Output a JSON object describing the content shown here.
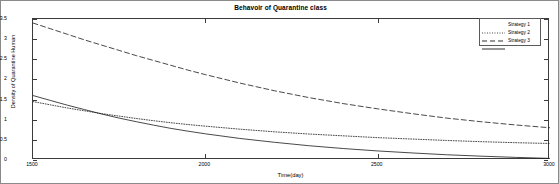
{
  "chart_data": {
    "type": "line",
    "title": "Behavoir of Quarantine class",
    "xlabel": "Time(day)",
    "ylabel": "Density of Quarantine Human",
    "xlim": [
      1500,
      3000
    ],
    "ylim": [
      0,
      3.5
    ],
    "grid": false,
    "legend_position": "top-right",
    "xticks": [
      1500,
      2000,
      2500,
      3000
    ],
    "xtick_labels": [
      "1500",
      "2000",
      "2500",
      "3000"
    ],
    "yticks": [
      0,
      0.5,
      1,
      1.5,
      2,
      2.5,
      3,
      3.5
    ],
    "ytick_labels": [
      "0",
      "0.5",
      "1",
      "1.5",
      "2",
      "2.5",
      "3",
      "3.5"
    ],
    "series": [
      {
        "name": "Strategy 1",
        "style": "dotted",
        "color": "#1a1a1a",
        "x": [
          1500,
          1550,
          1600,
          1650,
          1700,
          1750,
          1800,
          1850,
          1900,
          1950,
          2000,
          2100,
          2200,
          2300,
          2400,
          2500,
          2600,
          2700,
          2800,
          2900,
          3000
        ],
        "values": [
          1.45,
          1.37,
          1.29,
          1.22,
          1.15,
          1.09,
          1.03,
          0.975,
          0.925,
          0.88,
          0.84,
          0.765,
          0.7,
          0.645,
          0.6,
          0.555,
          0.52,
          0.485,
          0.455,
          0.43,
          0.41
        ]
      },
      {
        "name": "Strategy 2",
        "style": "dashed",
        "color": "#1a1a1a",
        "x": [
          1500,
          1550,
          1600,
          1650,
          1700,
          1750,
          1800,
          1850,
          1900,
          1950,
          2000,
          2100,
          2200,
          2300,
          2400,
          2500,
          2600,
          2700,
          2800,
          2900,
          3000
        ],
        "values": [
          3.4,
          3.26,
          3.12,
          2.98,
          2.85,
          2.72,
          2.59,
          2.47,
          2.35,
          2.23,
          2.12,
          1.91,
          1.72,
          1.55,
          1.4,
          1.27,
          1.15,
          1.04,
          0.95,
          0.87,
          0.8
        ]
      },
      {
        "name": "Strategy 3",
        "style": "solid",
        "color": "#1a1a1a",
        "x": [
          1500,
          1550,
          1600,
          1650,
          1700,
          1750,
          1800,
          1850,
          1900,
          1950,
          2000,
          2100,
          2200,
          2300,
          2400,
          2500,
          2600,
          2700,
          2800,
          2900,
          3000
        ],
        "values": [
          1.6,
          1.48,
          1.36,
          1.25,
          1.14,
          1.04,
          0.95,
          0.865,
          0.785,
          0.715,
          0.65,
          0.535,
          0.44,
          0.355,
          0.285,
          0.225,
          0.175,
          0.13,
          0.095,
          0.065,
          0.04
        ]
      }
    ],
    "legend": [
      "Strategy 1",
      "Strategy 2",
      "Strategy 3"
    ]
  }
}
